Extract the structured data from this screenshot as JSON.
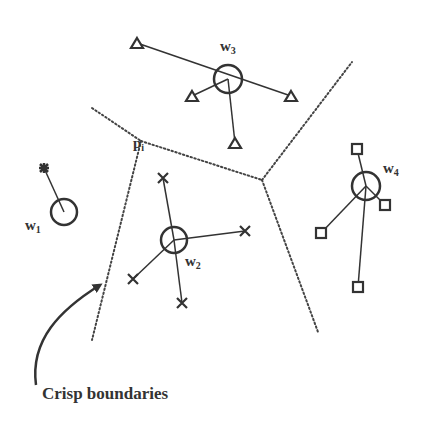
{
  "diagram": {
    "type": "voronoi-partition",
    "colors": {
      "ink": "#333333",
      "background": "#ffffff"
    },
    "boundary_style": "dotted",
    "point_label": {
      "base": "p",
      "sub": "i"
    },
    "prototypes": [
      {
        "id": "w1",
        "base": "w",
        "sub": "1",
        "marker": "star"
      },
      {
        "id": "w2",
        "base": "w",
        "sub": "2",
        "marker": "x"
      },
      {
        "id": "w3",
        "base": "w",
        "sub": "3",
        "marker": "triangle"
      },
      {
        "id": "w4",
        "base": "w",
        "sub": "4",
        "marker": "square"
      }
    ],
    "caption": "Crisp boundaries"
  }
}
